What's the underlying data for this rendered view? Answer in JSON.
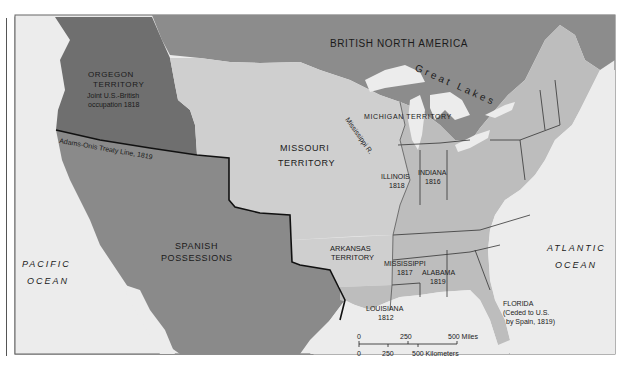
{
  "map": {
    "colors": {
      "ocean": "#ececec",
      "british": "#8c8c8c",
      "oregon": "#6f6f6f",
      "spanish": "#8a8a8a",
      "us_territory": "#cfcfcf",
      "states": "#bdbdbd",
      "lakes": "#ececec",
      "border": "#111111"
    },
    "regions": {
      "british_north_america": "BRITISH NORTH AMERICA",
      "great_lakes": "Great Lakes",
      "oregon_title": "ORGEGON",
      "oregon_title2": "TERRITORY",
      "oregon_note1": "Joint U.S.-British",
      "oregon_note2": "occupation 1818",
      "treaty_line": "Adams-Onis Treaty Line, 1819",
      "missouri1": "MISSOURI",
      "missouri2": "TERRITORY",
      "mississippi_river": "Mississippi R.",
      "michigan": "MICHIGAN TERRITORY",
      "spanish1": "SPANISH",
      "spanish2": "POSSESSIONS",
      "arkansas1": "ARKANSAS",
      "arkansas2": "TERRITORY"
    },
    "states": {
      "illinois": "ILLINOIS",
      "illinois_year": "1818",
      "indiana": "INDIANA",
      "indiana_year": "1816",
      "mississippi": "MISSISSIPPI",
      "mississippi_year": "1817",
      "alabama": "ALABAMA",
      "alabama_year": "1819",
      "louisiana": "LOUISIANA",
      "louisiana_year": "1812",
      "florida": "FLORIDA",
      "florida_note1": "(Ceded to U.S.",
      "florida_note2": "by Spain, 1819)"
    },
    "oceans": {
      "pacific1": "PACIFIC",
      "pacific2": "OCEAN",
      "atlantic1": "ATLANTIC",
      "atlantic2": "OCEAN"
    },
    "scale": {
      "miles_0": "0",
      "miles_250": "250",
      "miles_500": "500 Miles",
      "km_0": "0",
      "km_250": "250",
      "km_500": "500 Kilometers"
    }
  }
}
